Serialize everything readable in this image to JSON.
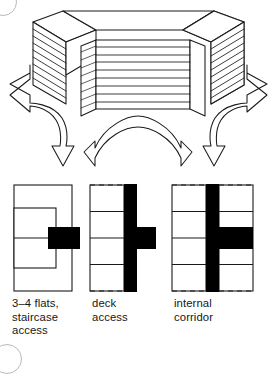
{
  "figure": {
    "ink_color": "#1a1a1a",
    "solid_fill_color": "#000000",
    "paper_color": "#ffffff",
    "margin_mark_color": "#b9b9b9"
  },
  "axonometric": {
    "name": "perspective-housing-block",
    "description": "Axonometric drawing of a stepped housing slab with two angled wings and a recessed central block, with movement arrows radiating outward",
    "central_block": {
      "label": "central slab",
      "floor_line_count": 9
    },
    "left_wing": {
      "label": "left wing",
      "floor_line_count": 9
    },
    "right_wing": {
      "label": "right wing",
      "floor_line_count": 9
    },
    "arrows": [
      {
        "name": "arrow-left-curved",
        "direction": "left",
        "style": "double-headed curved"
      },
      {
        "name": "arrow-right-curved",
        "direction": "right",
        "style": "double-headed curved"
      },
      {
        "name": "arrow-bottom-arc",
        "direction": "bidirectional",
        "style": "double-headed arc"
      }
    ]
  },
  "plans": [
    {
      "id": "plan-1",
      "name": "plan-staircase-access",
      "caption": "3–4 flats,\nstaircase\naccess",
      "core_type": "point block stair core",
      "outline_style": "solid",
      "has_dashed_edges": false,
      "core_orientation": "horizontal stub, right of centre"
    },
    {
      "id": "plan-2",
      "name": "plan-deck-access",
      "caption": "deck\naccess",
      "core_type": "external deck on one side",
      "outline_style": "solid with dashed top and bottom",
      "has_dashed_edges": true,
      "unit_count": 4,
      "core_orientation": "vertical deck on right edge with horizontal stair stub"
    },
    {
      "id": "plan-3",
      "name": "plan-internal-corridor",
      "caption": "internal\ncorridor",
      "core_type": "central internal corridor, double loaded",
      "outline_style": "solid with dashed top and bottom",
      "has_dashed_edges": true,
      "unit_count": 8,
      "core_orientation": "vertical central corridor with horizontal stair stub to the right"
    }
  ],
  "margin_marks": [
    {
      "name": "margin-circle-top",
      "shape": "circle"
    },
    {
      "name": "margin-circle-bottom",
      "shape": "circle"
    }
  ]
}
